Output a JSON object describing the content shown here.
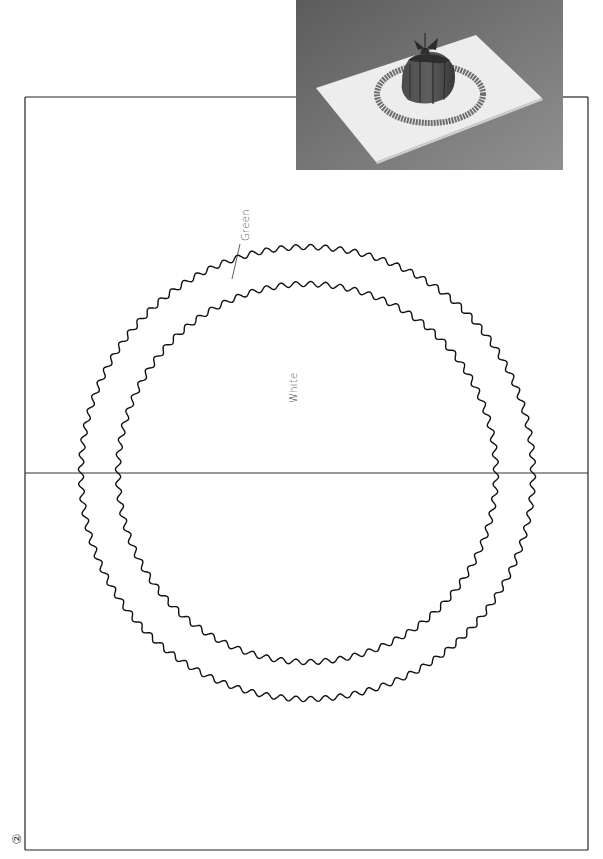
{
  "page": {
    "number_label": "②",
    "background": "#ffffff"
  },
  "photo": {
    "description": "Pop-up card photo: white card with grey scalloped ring and dark dome-shaped cake with bow",
    "background_gradient": [
      "#5e5e5e",
      "#7a7a7a",
      "#8e8e8e"
    ],
    "card_color": "#efefef",
    "ring_color": "#6f6f6f",
    "dome_color": "#3a3a3a",
    "dome_light": "#5a5a5a"
  },
  "template": {
    "frame": {
      "x": 25,
      "y": 97,
      "width": 563,
      "height": 753,
      "stroke": "#222222"
    },
    "fold_line": {
      "y": 473,
      "x1": 25,
      "x2": 588,
      "stroke": "#333333"
    },
    "outer_circle": {
      "cx": 307,
      "cy": 473,
      "r": 226,
      "amplitude": 2.6,
      "waves": 96,
      "stroke": "#111111"
    },
    "inner_circle": {
      "cx": 307,
      "cy": 473,
      "r": 189,
      "amplitude": 2.6,
      "waves": 80,
      "stroke": "#111111"
    }
  },
  "labels": {
    "green": {
      "text": "Green",
      "x": 240,
      "y": 241
    },
    "white": {
      "text": "White",
      "x": 288,
      "y": 403
    }
  },
  "leader": {
    "x1": 232,
    "y1": 279,
    "x2": 240,
    "y2": 244
  }
}
